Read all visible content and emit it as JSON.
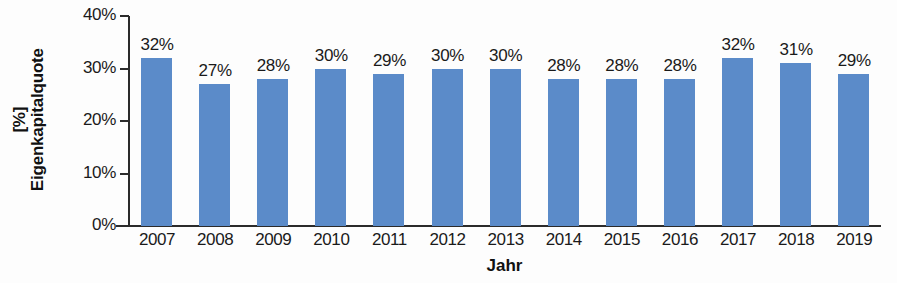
{
  "chart_data": {
    "type": "bar",
    "title": "",
    "subtitle": "",
    "xlabel": "Jahr",
    "ylabel": "Eigenkapitalquote [%]",
    "ylabel_line1": "Eigenkapitalquote",
    "ylabel_line2": "[%]",
    "categories": [
      "2007",
      "2008",
      "2009",
      "2010",
      "2011",
      "2012",
      "2013",
      "2014",
      "2015",
      "2016",
      "2017",
      "2018",
      "2019"
    ],
    "values": [
      32,
      27,
      28,
      30,
      29,
      30,
      30,
      28,
      28,
      28,
      32,
      31,
      29
    ],
    "data_labels": [
      "32%",
      "27%",
      "28%",
      "30%",
      "29%",
      "30%",
      "30%",
      "28%",
      "28%",
      "28%",
      "32%",
      "31%",
      "29%"
    ],
    "ylim": [
      0,
      40
    ],
    "ytick_values": [
      0,
      10,
      20,
      30,
      40
    ],
    "ytick_labels": [
      "0%",
      "10%",
      "20%",
      "30%",
      "40%"
    ],
    "grid": false,
    "legend": null,
    "legend_position": "none",
    "series_color": "#5b8bc9",
    "axis_color": "#2b2b2b",
    "text_color": "#1a1a1a",
    "background_color": "#fdfdfd"
  }
}
